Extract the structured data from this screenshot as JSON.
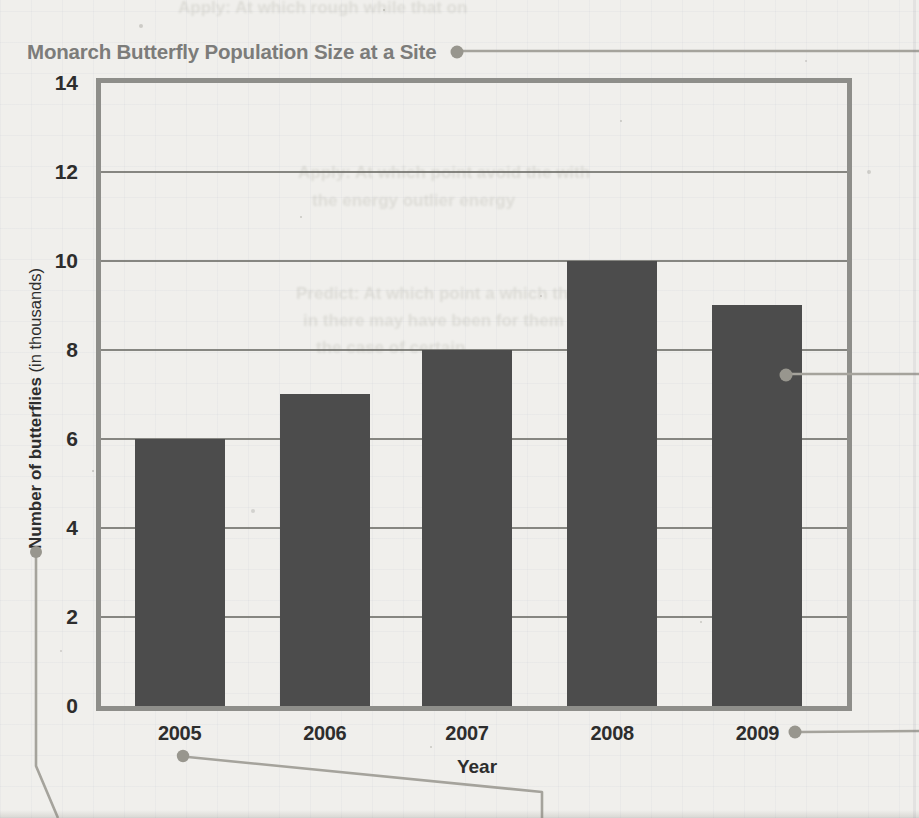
{
  "page": {
    "paper_color": "#f0efec"
  },
  "chart_data": {
    "type": "bar",
    "title": "Monarch Butterfly Population Size at a Site",
    "categories": [
      "2005",
      "2006",
      "2007",
      "2008",
      "2009"
    ],
    "values": [
      6,
      7,
      8,
      10,
      9
    ],
    "xlabel": "Year",
    "ylabel_main": "Number of butterflies",
    "ylabel_unit": " (in thousands)",
    "ylim": [
      0,
      14
    ],
    "yticks": [
      0,
      2,
      4,
      6,
      8,
      10,
      12,
      14
    ],
    "grid": "horizontal gridlines at every 2 units",
    "legend": "none",
    "bar_color": "#4c4c4c",
    "frame_color": "#8e8e8a",
    "gridline_color": "#63635d",
    "tick_label_color": "#2d2d2d",
    "title_color": "#7c7c7a"
  },
  "callouts": {
    "color": "#a5a39c",
    "dot_color": "#98968e",
    "markers": [
      {
        "name": "title-callout",
        "points_to": "chart title",
        "runs_to": "right edge"
      },
      {
        "name": "y-axis-label-callout",
        "points_to": "y-axis label",
        "runs_to": "bottom edge"
      },
      {
        "name": "x-tick-2005-callout",
        "points_to": "2005 tick label",
        "runs_to": "bottom edge"
      },
      {
        "name": "bar-2009-callout",
        "points_to": "2009 bar",
        "runs_to": "right edge"
      },
      {
        "name": "x-tick-2009-callout",
        "points_to": "2009 tick label",
        "runs_to": "right edge"
      }
    ]
  },
  "ghost_lines": [
    "Apply: At which  rough  while  that on",
    "Apply: At which point  avoid the  with",
    "the energy   outlier energy",
    "Predict: At which point  a  which the",
    "in  there  may have been  for them",
    "the  case of  certain"
  ]
}
